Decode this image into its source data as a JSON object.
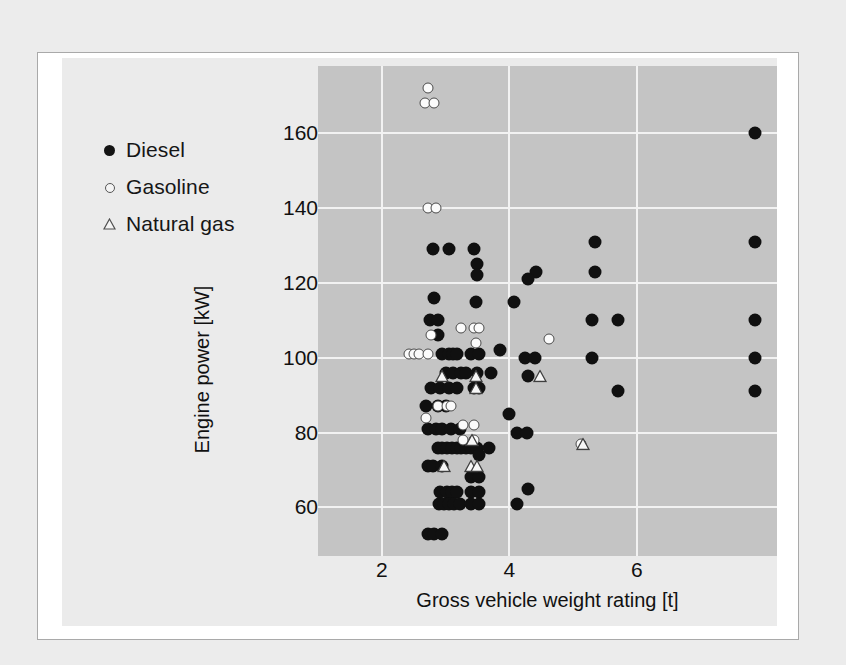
{
  "figure": {
    "background_color": "#ebebeb",
    "panel_color": "#c4c4c4",
    "gridline_color": "#f2f2f2"
  },
  "legend": {
    "items": [
      {
        "label": "Diesel",
        "marker": "filled-circle-icon",
        "color": "#101010"
      },
      {
        "label": "Gasoline",
        "marker": "open-circle-icon",
        "color": "#fbfbfb"
      },
      {
        "label": "Natural gas",
        "marker": "open-triangle-icon",
        "color": "#fbfbfb"
      }
    ]
  },
  "chart_data": {
    "type": "scatter",
    "title": "",
    "xlabel": "Gross vehicle weight rating  [t]",
    "ylabel": "Engine power [kW]",
    "xlim": [
      1.0,
      8.2
    ],
    "ylim": [
      47,
      178
    ],
    "xticks": [
      2,
      4,
      6
    ],
    "yticks": [
      60,
      80,
      100,
      120,
      140,
      160
    ],
    "xtick_labels": [
      "2",
      "4",
      "6"
    ],
    "ytick_labels": [
      "60",
      "80",
      "100",
      "120",
      "140",
      "160"
    ],
    "grid": true,
    "legend_position": "outside-left-top",
    "series": [
      {
        "name": "Diesel",
        "marker": "filled-circle",
        "color": "#101010",
        "points": [
          [
            2.8,
            129
          ],
          [
            3.05,
            129
          ],
          [
            3.45,
            129
          ],
          [
            3.5,
            125
          ],
          [
            3.5,
            122
          ],
          [
            2.82,
            116
          ],
          [
            3.48,
            115
          ],
          [
            2.75,
            110
          ],
          [
            2.88,
            110
          ],
          [
            2.88,
            106
          ],
          [
            2.95,
            101
          ],
          [
            3.05,
            101
          ],
          [
            3.12,
            101
          ],
          [
            3.18,
            101
          ],
          [
            3.4,
            101
          ],
          [
            3.52,
            101
          ],
          [
            3.0,
            96
          ],
          [
            3.12,
            96
          ],
          [
            3.25,
            96
          ],
          [
            3.32,
            96
          ],
          [
            3.5,
            96
          ],
          [
            2.78,
            92
          ],
          [
            2.92,
            92
          ],
          [
            3.05,
            92
          ],
          [
            3.18,
            92
          ],
          [
            3.45,
            92
          ],
          [
            3.52,
            92
          ],
          [
            2.7,
            87
          ],
          [
            2.88,
            87
          ],
          [
            3.0,
            87
          ],
          [
            2.72,
            81
          ],
          [
            2.85,
            81
          ],
          [
            2.95,
            81
          ],
          [
            3.08,
            81
          ],
          [
            3.22,
            81
          ],
          [
            2.88,
            76
          ],
          [
            2.95,
            76
          ],
          [
            3.02,
            76
          ],
          [
            3.1,
            76
          ],
          [
            3.18,
            76
          ],
          [
            3.25,
            76
          ],
          [
            3.32,
            76
          ],
          [
            3.4,
            76
          ],
          [
            3.5,
            76
          ],
          [
            3.52,
            74
          ],
          [
            2.72,
            71
          ],
          [
            2.8,
            71
          ],
          [
            2.95,
            71
          ],
          [
            3.4,
            68
          ],
          [
            3.52,
            68
          ],
          [
            2.92,
            64
          ],
          [
            3.02,
            64
          ],
          [
            3.1,
            64
          ],
          [
            3.18,
            64
          ],
          [
            3.4,
            64
          ],
          [
            3.52,
            64
          ],
          [
            2.9,
            61
          ],
          [
            2.98,
            61
          ],
          [
            3.06,
            61
          ],
          [
            3.14,
            61
          ],
          [
            3.22,
            61
          ],
          [
            3.4,
            61
          ],
          [
            3.52,
            61
          ],
          [
            2.72,
            53
          ],
          [
            2.82,
            53
          ],
          [
            2.95,
            53
          ],
          [
            3.85,
            102
          ],
          [
            4.08,
            115
          ],
          [
            4.42,
            123
          ],
          [
            4.3,
            121
          ],
          [
            3.72,
            96
          ],
          [
            4.3,
            95
          ],
          [
            4.25,
            100
          ],
          [
            4.4,
            100
          ],
          [
            4.0,
            85
          ],
          [
            4.12,
            80
          ],
          [
            4.28,
            80
          ],
          [
            3.68,
            76
          ],
          [
            4.3,
            65
          ],
          [
            4.12,
            61
          ],
          [
            5.35,
            131
          ],
          [
            5.35,
            123
          ],
          [
            5.3,
            110
          ],
          [
            5.7,
            110
          ],
          [
            5.3,
            100
          ],
          [
            5.7,
            91
          ],
          [
            7.85,
            160
          ],
          [
            7.85,
            131
          ],
          [
            7.85,
            110
          ],
          [
            7.85,
            100
          ],
          [
            7.85,
            91
          ]
        ]
      },
      {
        "name": "Gasoline",
        "marker": "open-circle",
        "color": "#fbfbfb",
        "points": [
          [
            2.72,
            172
          ],
          [
            2.68,
            168
          ],
          [
            2.82,
            168
          ],
          [
            2.72,
            140
          ],
          [
            2.85,
            140
          ],
          [
            3.25,
            108
          ],
          [
            3.45,
            108
          ],
          [
            3.52,
            108
          ],
          [
            2.78,
            106
          ],
          [
            3.48,
            104
          ],
          [
            2.42,
            101
          ],
          [
            2.5,
            101
          ],
          [
            2.58,
            101
          ],
          [
            2.72,
            101
          ],
          [
            2.88,
            87
          ],
          [
            3.02,
            87
          ],
          [
            3.08,
            87
          ],
          [
            2.7,
            84
          ],
          [
            3.28,
            82
          ],
          [
            3.45,
            82
          ],
          [
            3.28,
            78
          ],
          [
            3.45,
            78
          ],
          [
            4.62,
            105
          ],
          [
            5.12,
            77
          ]
        ]
      },
      {
        "name": "Natural gas",
        "marker": "open-triangle",
        "color": "#fbfbfb",
        "points": [
          [
            2.95,
            95
          ],
          [
            3.48,
            95
          ],
          [
            3.48,
            92
          ],
          [
            4.48,
            95
          ],
          [
            3.42,
            78
          ],
          [
            2.98,
            71
          ],
          [
            3.4,
            71
          ],
          [
            3.5,
            71
          ],
          [
            5.15,
            77
          ]
        ]
      }
    ]
  }
}
